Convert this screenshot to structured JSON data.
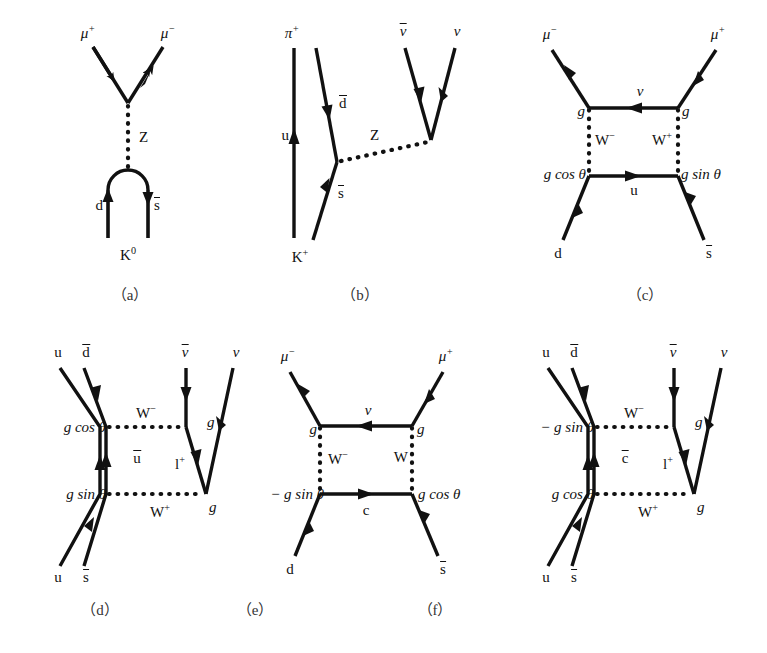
{
  "figure": {
    "type": "feynman-diagram-set",
    "panel_count": 6,
    "line_color": "#111111",
    "background": "#ffffff",
    "captions": [
      "（a）",
      "（b）",
      "（c）",
      "（d）",
      "（e）",
      "（f）"
    ]
  },
  "panel_a": {
    "caption": "（a）",
    "labels": {
      "mu_plus": "μ",
      "mu_plus_sup": "+",
      "mu_minus": "μ",
      "mu_minus_sup": "−",
      "boson": "Z",
      "quark_d": "d",
      "quark_sbar": "s",
      "meson": "K",
      "meson_sup": "0"
    }
  },
  "panel_b": {
    "caption": "（b）",
    "labels": {
      "pion": "π",
      "pion_sup": "+",
      "nu_bar": "ν",
      "nu": "ν",
      "quark_u": "u",
      "quark_dbar": "d",
      "boson": "Z",
      "quark_sbar": "s",
      "kaon": "K",
      "kaon_sup": "+"
    }
  },
  "panel_c": {
    "caption": "（c）",
    "labels": {
      "mu_minus": "μ",
      "mu_minus_sup": "−",
      "mu_plus": "μ",
      "mu_plus_sup": "+",
      "neutrino": "ν",
      "coupling_left_top": "g",
      "coupling_right_top": "g",
      "w_minus": "W",
      "w_minus_sup": "−",
      "w_plus": "W",
      "w_plus_sup": "+",
      "coupling_left_bottom": "g cos θ",
      "coupling_right_bottom": "g sin θ",
      "quark_u": "u",
      "quark_d": "d",
      "quark_sbar": "s"
    }
  },
  "panel_d": {
    "caption": "（d）",
    "labels": {
      "quark_u_top": "u",
      "quark_dbar": "d",
      "nu_bar": "ν",
      "nu": "ν",
      "w_minus": "W",
      "w_minus_sup": "−",
      "coupling_top": "g cos θ",
      "coupling_bottom": "g sin θ",
      "quark_ubar": "u",
      "lepton": "l",
      "lepton_sup": "+",
      "coupling_g_top": "g",
      "coupling_g_bottom": "g",
      "w_plus": "W",
      "w_plus_sup": "+",
      "quark_u_bottom": "u",
      "quark_sbar": "s"
    }
  },
  "panel_e": {
    "caption": "（e）",
    "labels": {
      "mu_minus": "μ",
      "mu_minus_sup": "−",
      "mu_plus": "μ",
      "mu_plus_sup": "+",
      "neutrino": "ν",
      "coupling_left_top": "g",
      "coupling_right_top": "g",
      "w_minus": "W",
      "w_minus_sup": "−",
      "w_plus": "W",
      "coupling_left_bottom": "− g sin θ",
      "coupling_right_bottom": "g cos θ",
      "quark_c": "c",
      "quark_d": "d",
      "quark_sbar": "s"
    }
  },
  "panel_f": {
    "caption": "（f）",
    "labels": {
      "quark_u_top": "u",
      "quark_dbar": "d",
      "nu_bar": "ν",
      "nu": "ν",
      "w_minus": "W",
      "w_minus_sup": "−",
      "coupling_top": "− g sin θ",
      "coupling_bottom": "g cos θ",
      "quark_cbar": "c",
      "lepton": "l",
      "lepton_sup": "+",
      "coupling_g_top": "g",
      "coupling_g_bottom": "g",
      "w_plus": "W",
      "w_plus_sup": "+",
      "quark_u_bottom": "u",
      "quark_sbar": "s"
    }
  }
}
